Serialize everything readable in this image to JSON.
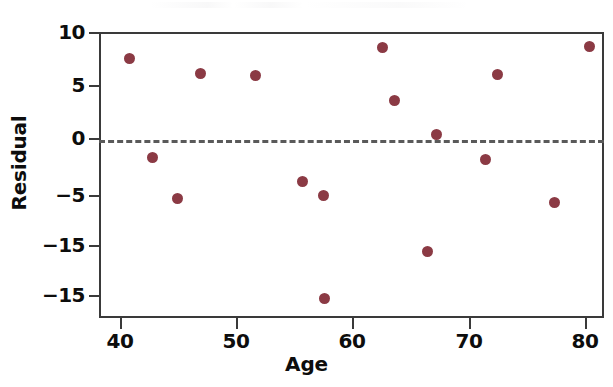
{
  "chart_data": {
    "type": "scatter",
    "title": "",
    "xlabel": "Age",
    "ylabel": "Residual",
    "xlim": [
      38.0,
      81.7
    ],
    "ylim": [
      -17.5,
      10.0
    ],
    "grid": false,
    "legend": null,
    "xticks": [
      40,
      50,
      60,
      70,
      80
    ],
    "xtick_labels": [
      "40",
      "50",
      "60",
      "70",
      "80"
    ],
    "yticks": [
      10,
      5,
      0,
      -5,
      -15,
      -15
    ],
    "ytick_labels": [
      "10",
      "5",
      "0",
      "-5",
      "-15",
      "-15"
    ],
    "reference_line": {
      "y": 0,
      "style": "dashed",
      "color": "#5a5a5a"
    },
    "marker": {
      "shape": "circle",
      "color": "#8b3a44",
      "size": 11
    },
    "x": [
      39.6,
      41.6,
      43.9,
      45.8,
      50.6,
      55.0,
      56.9,
      57.0,
      61.9,
      62.5,
      66.0,
      66.6,
      71.1,
      71.9,
      76.7,
      80.2
    ],
    "y": [
      7.7,
      -1.4,
      -5.4,
      6.3,
      6.1,
      -3.9,
      -5.0,
      -14.9,
      8.8,
      3.8,
      -15.4,
      0.6,
      -1.7,
      6.2,
      -5.8,
      9.0
    ],
    "points": [
      {
        "x": 39.6,
        "y": 7.7,
        "px": 127,
        "py": 56
      },
      {
        "x": 41.6,
        "y": -1.4,
        "px": 150,
        "py": 155
      },
      {
        "x": 43.9,
        "y": -5.4,
        "px": 175,
        "py": 196
      },
      {
        "x": 45.8,
        "y": 6.3,
        "px": 198,
        "py": 71
      },
      {
        "x": 50.6,
        "y": 6.1,
        "px": 253,
        "py": 73
      },
      {
        "x": 55.0,
        "y": -3.9,
        "px": 300,
        "py": 179
      },
      {
        "x": 56.9,
        "y": -5.0,
        "px": 321,
        "py": 193
      },
      {
        "x": 57.0,
        "y": -14.9,
        "px": 322,
        "py": 296
      },
      {
        "x": 61.9,
        "y": 8.8,
        "px": 380,
        "py": 45
      },
      {
        "x": 62.5,
        "y": 3.8,
        "px": 392,
        "py": 98
      },
      {
        "x": 66.0,
        "y": -15.4,
        "px": 425,
        "py": 249
      },
      {
        "x": 66.6,
        "y": 0.6,
        "px": 434,
        "py": 132
      },
      {
        "x": 71.1,
        "y": -1.7,
        "px": 483,
        "py": 157
      },
      {
        "x": 71.9,
        "y": 6.2,
        "px": 495,
        "py": 72
      },
      {
        "x": 76.7,
        "y": -5.8,
        "px": 552,
        "py": 200
      },
      {
        "x": 80.2,
        "y": 9.0,
        "px": 587,
        "py": 44
      }
    ]
  },
  "axes": {
    "y_title": "Residual",
    "x_title": "Age",
    "y_ticks": [
      {
        "label": "10",
        "py": 32
      },
      {
        "label": "5",
        "py": 85
      },
      {
        "label": "0",
        "py": 138
      },
      {
        "label": "-5",
        "py": 195
      },
      {
        "label": "-15",
        "py": 245
      },
      {
        "label": "-15",
        "py": 295
      }
    ],
    "x_ticks": [
      {
        "label": "40",
        "px": 120
      },
      {
        "label": "50",
        "px": 236
      },
      {
        "label": "60",
        "px": 352
      },
      {
        "label": "70",
        "px": 469
      },
      {
        "label": "80",
        "px": 585
      }
    ]
  },
  "style": {
    "marker_color": "#8b3a44",
    "axis_color": "#3a3a3a",
    "zero_line_color": "#5a5a5a",
    "text_color": "#0d0d0d",
    "background": "#ffffff"
  }
}
